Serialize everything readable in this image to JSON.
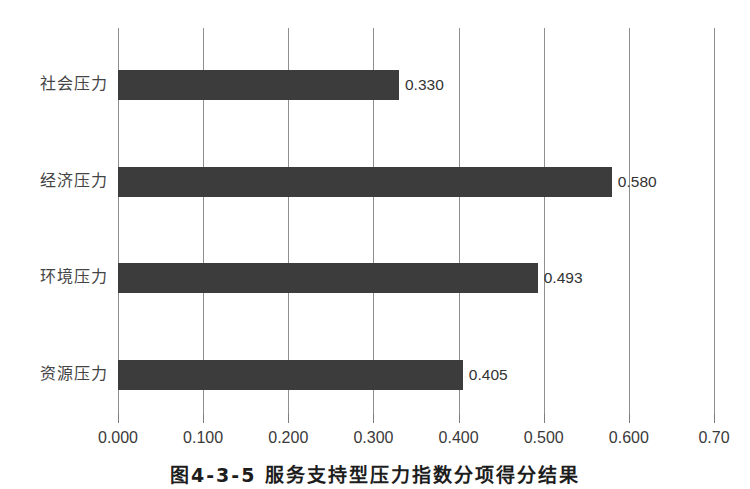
{
  "chart_data": {
    "type": "bar",
    "orientation": "horizontal",
    "title": "",
    "subtitle": "",
    "xlabel": "",
    "ylabel": "",
    "categories": [
      "社会压力",
      "经济压力",
      "环境压力",
      "资源压力"
    ],
    "values": [
      0.33,
      0.58,
      0.493,
      0.405
    ],
    "value_labels": [
      "0.330",
      "0.580",
      "0.493",
      "0.405"
    ],
    "xlim": [
      0.0,
      0.7
    ],
    "xticks": [
      0.0,
      0.1,
      0.2,
      0.3,
      0.4,
      0.5,
      0.6,
      0.7
    ],
    "xtick_labels": [
      "0.000",
      "0.100",
      "0.200",
      "0.300",
      "0.400",
      "0.500",
      "0.600",
      "0.70"
    ],
    "grid": "vertical",
    "legend": "none",
    "series": [
      {
        "name": "",
        "values": [
          0.33,
          0.58,
          0.493,
          0.405
        ]
      }
    ],
    "bar_color": "#3c3c3c",
    "grid_color": "#8e8e8e",
    "text_color": "#333333"
  },
  "caption": {
    "text": "图4-3-5  服务支持型压力指数分项得分结果"
  }
}
